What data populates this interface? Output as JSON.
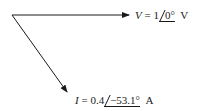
{
  "diagram": {
    "type": "phasor-diagram",
    "colors": {
      "stroke": "#1a1a1a",
      "background": "#ffffff"
    },
    "origin": {
      "x": 12,
      "y": 15
    },
    "phasors": [
      {
        "name": "voltage",
        "symbol": "V",
        "equals": "=",
        "magnitude": "1",
        "angle": "0°",
        "unit": "V",
        "tip": {
          "x": 129,
          "y": 15
        }
      },
      {
        "name": "current",
        "symbol": "I",
        "equals": "=",
        "magnitude": "0.4",
        "angle": "−53.1°",
        "unit": "A",
        "tip": {
          "x": 67,
          "y": 92
        }
      }
    ]
  }
}
